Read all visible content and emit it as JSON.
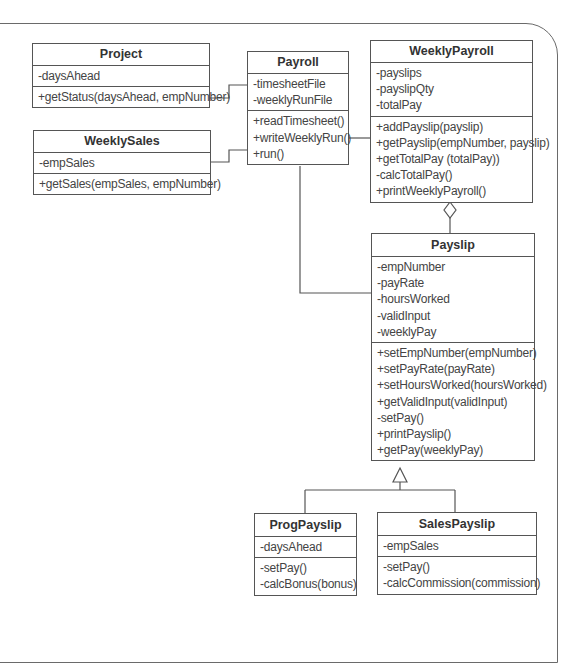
{
  "diagram": {
    "type": "uml-class-diagram",
    "classes": {
      "project": {
        "name": "Project",
        "attributes": [
          "-daysAhead"
        ],
        "operations": [
          "+getStatus(daysAhead, empNumber)"
        ]
      },
      "weekly_sales": {
        "name": "WeeklySales",
        "attributes": [
          "-empSales"
        ],
        "operations": [
          "+getSales(empSales, empNumber)"
        ]
      },
      "payroll": {
        "name": "Payroll",
        "attributes": [
          "-timesheetFile",
          "-weeklyRunFile"
        ],
        "operations": [
          "+readTimesheet()",
          "+writeWeeklyRun()",
          "+run()"
        ]
      },
      "weekly_payroll": {
        "name": "WeeklyPayroll",
        "attributes": [
          "-payslips",
          "-payslipQty",
          "-totalPay"
        ],
        "operations": [
          "+addPayslip(payslip)",
          "+getPayslip(empNumber, payslip)",
          "+getTotalPay (totalPay))",
          "-calcTotalPay()",
          "+printWeeklyPayroll()"
        ]
      },
      "payslip": {
        "name": "Payslip",
        "attributes": [
          "-empNumber",
          "-payRate",
          "-hoursWorked",
          "-validInput",
          "-weeklyPay"
        ],
        "operations": [
          "+setEmpNumber(empNumber)",
          "+setPayRate(payRate)",
          "+setHoursWorked(hoursWorked)",
          "+getValidInput(validInput)",
          "-setPay()",
          "+printPayslip()",
          "+getPay(weeklyPay)"
        ]
      },
      "prog_payslip": {
        "name": "ProgPayslip",
        "attributes": [
          "-daysAhead"
        ],
        "operations": [
          "-setPay()",
          "-calcBonus(bonus)"
        ]
      },
      "sales_payslip": {
        "name": "SalesPayslip",
        "attributes": [
          "-empSales"
        ],
        "operations": [
          "-setPay()",
          "-calcCommission(commission)"
        ]
      }
    },
    "relationships": [
      {
        "from": "Project",
        "to": "Payroll",
        "kind": "association"
      },
      {
        "from": "WeeklySales",
        "to": "Payroll",
        "kind": "association"
      },
      {
        "from": "Payroll",
        "to": "WeeklyPayroll",
        "kind": "association"
      },
      {
        "from": "Payroll",
        "to": "Payslip",
        "kind": "association"
      },
      {
        "from": "Payslip",
        "to": "WeeklyPayroll",
        "kind": "aggregation",
        "icon": "hollow-diamond"
      },
      {
        "from": "ProgPayslip",
        "to": "Payslip",
        "kind": "generalization",
        "icon": "hollow-triangle"
      },
      {
        "from": "SalesPayslip",
        "to": "Payslip",
        "kind": "generalization",
        "icon": "hollow-triangle"
      }
    ],
    "colors": {
      "line": "#555555",
      "text": "#333333",
      "background": "#ffffff"
    }
  }
}
